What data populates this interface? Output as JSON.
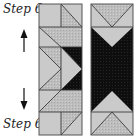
{
  "labels": {
    "top": "Step 6",
    "bottom": "Step 6"
  },
  "arrows": {
    "up": "up-arrow",
    "down": "down-arrow"
  },
  "colors": {
    "light": "#cacaca",
    "hatched": "#b9b9b9",
    "dark": "#111111",
    "line": "#3a3a3a",
    "border": "#555555"
  },
  "blocks": [
    {
      "name": "left-strip",
      "description": "Pieced strip with half-square triangles and flying geese, black triangles at center right"
    },
    {
      "name": "right-strip",
      "description": "Strip with black hourglass center and light triangles top and bottom"
    }
  ]
}
